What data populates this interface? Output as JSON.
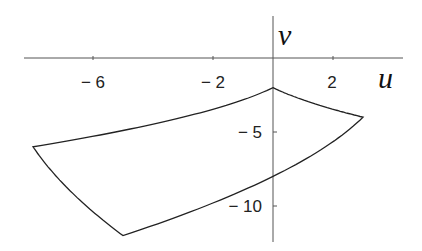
{
  "chart_data": {
    "type": "line",
    "title": "",
    "xlabel": "u",
    "ylabel": "v",
    "xlim": [
      -8.3,
      4.3
    ],
    "ylim": [
      -12.6,
      2.8
    ],
    "grid": false,
    "x_ticks": [
      -6,
      -2,
      2
    ],
    "x_tick_labels": [
      "-6",
      "-2",
      "2"
    ],
    "y_ticks": [
      -5,
      -10
    ],
    "y_tick_labels": [
      "-5",
      "-10"
    ],
    "series": [
      {
        "name": "boundary",
        "vertices": [
          {
            "u": 0,
            "v": -2
          },
          {
            "u": 3,
            "v": -4
          },
          {
            "u": -5,
            "v": -12
          },
          {
            "u": -8,
            "v": -6
          }
        ],
        "axis_crossing": {
          "u": 0,
          "v": -8
        }
      }
    ]
  },
  "labels": {
    "x_axis": "u",
    "y_axis": "v",
    "ticks": {
      "xm6": "− 6",
      "xm2": "− 2",
      "x2": "2",
      "ym5": "− 5",
      "ym10": "− 10"
    }
  }
}
